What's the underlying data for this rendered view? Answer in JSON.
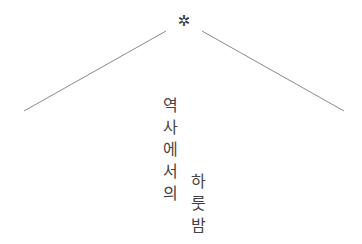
{
  "ornament": {
    "icon": "asterisk-icon",
    "glyph": "✲"
  },
  "title": {
    "column1": [
      "역",
      "사",
      "에",
      "서",
      "의"
    ],
    "column2": [
      "하",
      "룻",
      "밤"
    ],
    "full_text": "역사에서의 하룻밤"
  },
  "colors": {
    "line": "#8a8a8a",
    "text": "#444444",
    "ornament": "#333333",
    "background": "#ffffff"
  }
}
